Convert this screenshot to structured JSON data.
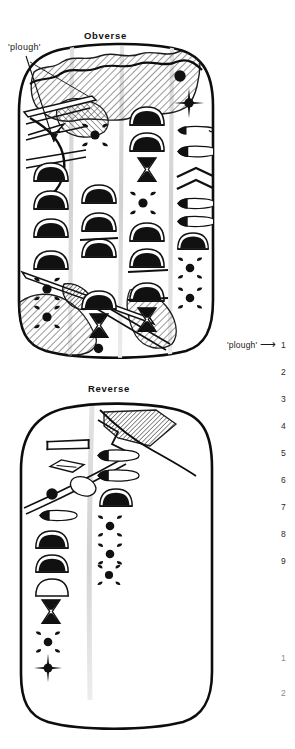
{
  "figure": {
    "kind": "archaeological-line-drawing",
    "background_color": "#ffffff",
    "ink_color": "#0d0d0d",
    "hatch_color": "#4a4a4a",
    "rule_color": "#d8d8d8"
  },
  "panels": [
    {
      "id": "obverse",
      "label": "Obverse"
    },
    {
      "id": "reverse",
      "label": "Reverse"
    }
  ],
  "annotations": {
    "plough_top": "'plough'",
    "plough_side": "'plough'",
    "arrow_glyph": "⟶"
  },
  "line_numbers": {
    "primary": [
      "1",
      "2",
      "3",
      "4",
      "5",
      "6",
      "7",
      "8",
      "9"
    ],
    "secondary": [
      "1",
      "2"
    ]
  }
}
